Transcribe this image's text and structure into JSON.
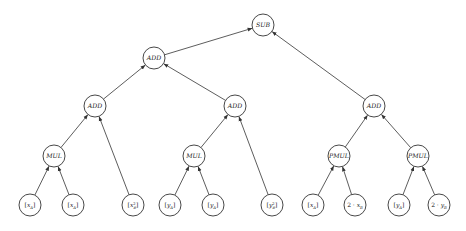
{
  "diagram": {
    "type": "computation-tree",
    "node_radius": 11,
    "colors": {
      "stroke": "#333333",
      "fill": "#ffffff",
      "text": "#222222"
    },
    "nodes": [
      {
        "id": "sub",
        "kind": "op",
        "label": "SUB",
        "x": 263,
        "y": 25
      },
      {
        "id": "add0",
        "kind": "op",
        "label": "ADD",
        "x": 154,
        "y": 58
      },
      {
        "id": "add1",
        "kind": "op",
        "label": "ADD",
        "x": 95,
        "y": 106
      },
      {
        "id": "add2",
        "kind": "op",
        "label": "ADD",
        "x": 235,
        "y": 106
      },
      {
        "id": "add3",
        "kind": "op",
        "label": "ADD",
        "x": 374,
        "y": 106
      },
      {
        "id": "mul1",
        "kind": "op",
        "label": "MUL",
        "x": 54,
        "y": 156
      },
      {
        "id": "mul2",
        "kind": "op",
        "label": "MUL",
        "x": 194,
        "y": 156
      },
      {
        "id": "pmul1",
        "kind": "op",
        "label": "PMUL",
        "x": 339,
        "y": 156
      },
      {
        "id": "pmul2",
        "kind": "op",
        "label": "PMUL",
        "x": 418,
        "y": 156
      },
      {
        "id": "l1",
        "kind": "leaf",
        "label": "[x_A]",
        "base": "x",
        "sub": "A",
        "sup": "",
        "prefix": "[",
        "suffix": "]",
        "x": 30,
        "y": 205
      },
      {
        "id": "l2",
        "kind": "leaf",
        "label": "[x_A]",
        "base": "x",
        "sub": "A",
        "sup": "",
        "prefix": "[",
        "suffix": "]",
        "x": 73,
        "y": 205
      },
      {
        "id": "l3",
        "kind": "leaf",
        "label": "[x_B^2]",
        "base": "x",
        "sub": "B",
        "sup": "2",
        "prefix": "[",
        "suffix": "]",
        "x": 133,
        "y": 205
      },
      {
        "id": "l4",
        "kind": "leaf",
        "label": "[y_A]",
        "base": "y",
        "sub": "A",
        "sup": "",
        "prefix": "[",
        "suffix": "]",
        "x": 170,
        "y": 205
      },
      {
        "id": "l5",
        "kind": "leaf",
        "label": "[y_A]",
        "base": "y",
        "sub": "A",
        "sup": "",
        "prefix": "[",
        "suffix": "]",
        "x": 213,
        "y": 205
      },
      {
        "id": "l6",
        "kind": "leaf",
        "label": "[y_B^2]",
        "base": "y",
        "sub": "B",
        "sup": "2",
        "prefix": "[",
        "suffix": "]",
        "x": 272,
        "y": 205
      },
      {
        "id": "l7",
        "kind": "leaf",
        "label": "[x_A]",
        "base": "x",
        "sub": "A",
        "sup": "",
        "prefix": "[",
        "suffix": "]",
        "x": 313,
        "y": 205
      },
      {
        "id": "l8",
        "kind": "leaf",
        "label": "2·x_B",
        "base": "x",
        "sub": "B",
        "sup": "",
        "prefix": "2 · ",
        "suffix": "",
        "x": 355,
        "y": 205
      },
      {
        "id": "l9",
        "kind": "leaf",
        "label": "[y_A]",
        "base": "y",
        "sub": "A",
        "sup": "",
        "prefix": "[",
        "suffix": "]",
        "x": 399,
        "y": 205
      },
      {
        "id": "l10",
        "kind": "leaf",
        "label": "2·y_B",
        "base": "y",
        "sub": "B",
        "sup": "",
        "prefix": "2 · ",
        "suffix": "",
        "x": 439,
        "y": 205
      }
    ],
    "edges": [
      {
        "from": "add0",
        "to": "sub"
      },
      {
        "from": "add3",
        "to": "sub"
      },
      {
        "from": "add1",
        "to": "add0"
      },
      {
        "from": "add2",
        "to": "add0"
      },
      {
        "from": "mul1",
        "to": "add1"
      },
      {
        "from": "l3",
        "to": "add1"
      },
      {
        "from": "mul2",
        "to": "add2"
      },
      {
        "from": "l6",
        "to": "add2"
      },
      {
        "from": "pmul1",
        "to": "add3"
      },
      {
        "from": "pmul2",
        "to": "add3"
      },
      {
        "from": "l1",
        "to": "mul1"
      },
      {
        "from": "l2",
        "to": "mul1"
      },
      {
        "from": "l4",
        "to": "mul2"
      },
      {
        "from": "l5",
        "to": "mul2"
      },
      {
        "from": "l7",
        "to": "pmul1"
      },
      {
        "from": "l8",
        "to": "pmul1"
      },
      {
        "from": "l9",
        "to": "pmul2"
      },
      {
        "from": "l10",
        "to": "pmul2"
      }
    ]
  }
}
